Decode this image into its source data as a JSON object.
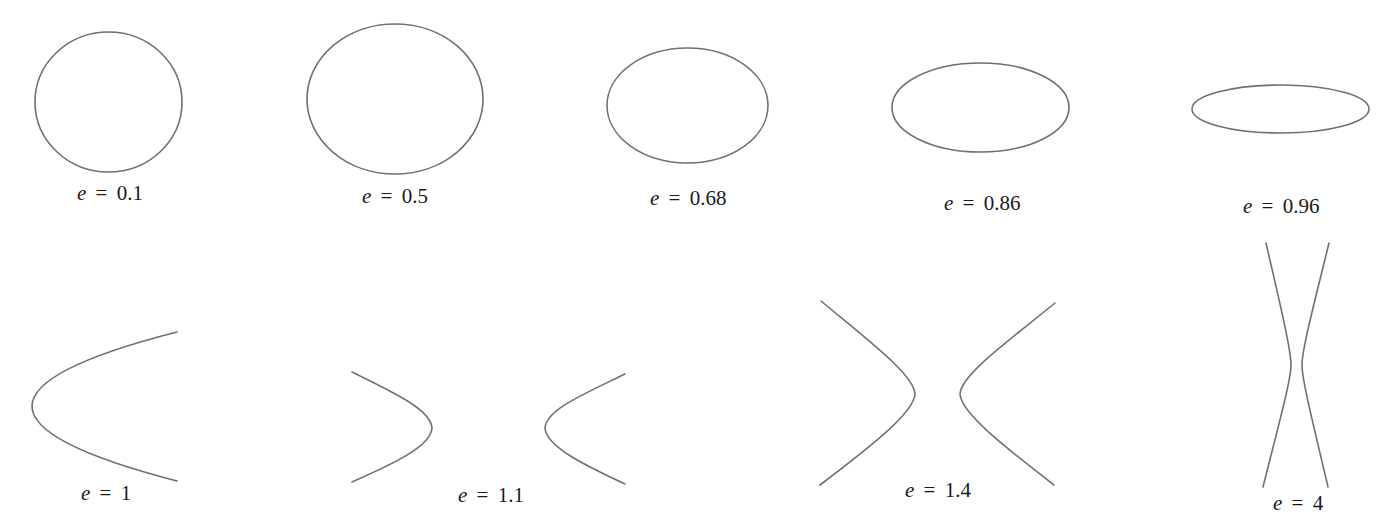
{
  "figure": {
    "stroke_color": "#707070",
    "text_color": "#1a1a1a",
    "background": "#ffffff",
    "variable": "e",
    "equals": "=",
    "conics": [
      {
        "id": "e-0-1",
        "type": "ellipse",
        "e": "0.1",
        "label_value": "0.1"
      },
      {
        "id": "e-0-5",
        "type": "ellipse",
        "e": "0.5",
        "label_value": "0.5"
      },
      {
        "id": "e-0-68",
        "type": "ellipse",
        "e": "0.68",
        "label_value": "0.68"
      },
      {
        "id": "e-0-86",
        "type": "ellipse",
        "e": "0.86",
        "label_value": "0.86"
      },
      {
        "id": "e-0-96",
        "type": "ellipse",
        "e": "0.96",
        "label_value": "0.96"
      },
      {
        "id": "e-1",
        "type": "parabola",
        "e": "1",
        "label_value": "1"
      },
      {
        "id": "e-1-1",
        "type": "hyperbola",
        "e": "1.1",
        "label_value": "1.1"
      },
      {
        "id": "e-1-4",
        "type": "hyperbola",
        "e": "1.4",
        "label_value": "1.4"
      },
      {
        "id": "e-4",
        "type": "hyperbola",
        "e": "4",
        "label_value": "4"
      }
    ]
  }
}
